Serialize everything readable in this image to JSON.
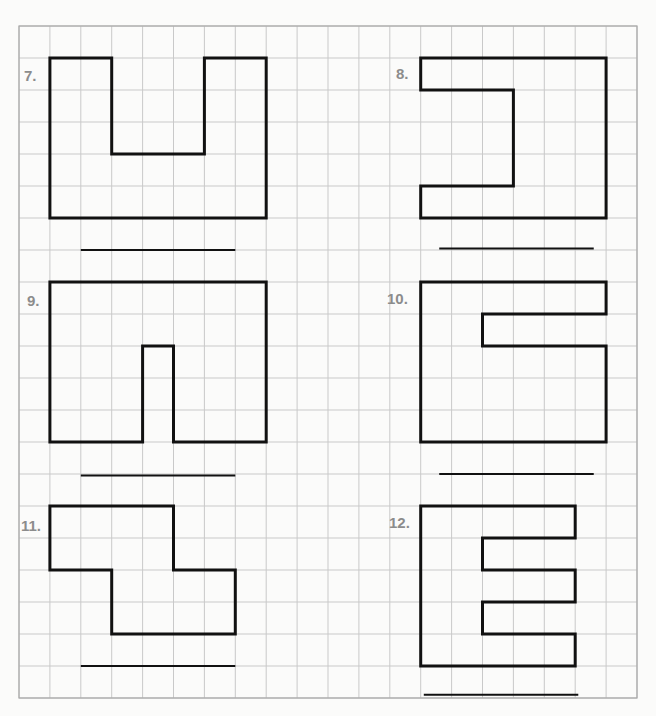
{
  "page": {
    "type": "worksheet",
    "background": "#fbfbfa"
  },
  "grid": {
    "origin_x": 19,
    "origin_y": 26,
    "cell_w": 30.9,
    "cell_h": 32,
    "cols": 20,
    "rows": 21,
    "line_color": "#c9c9c9"
  },
  "problems": [
    {
      "number": "7.",
      "label_pos": [
        24,
        81
      ],
      "outline": [
        [
          1,
          1
        ],
        [
          3,
          1
        ],
        [
          3,
          4
        ],
        [
          6,
          4
        ],
        [
          6,
          1
        ],
        [
          8,
          1
        ],
        [
          8,
          6
        ],
        [
          1,
          6
        ]
      ],
      "answer_line": {
        "from": [
          2,
          7
        ],
        "to": [
          7,
          7
        ],
        "value": ""
      }
    },
    {
      "number": "8.",
      "label_pos": [
        396,
        79
      ],
      "outline": [
        [
          13,
          1
        ],
        [
          19,
          1
        ],
        [
          19,
          6
        ],
        [
          13,
          6
        ],
        [
          13,
          5
        ],
        [
          16,
          5
        ],
        [
          16,
          2
        ],
        [
          13,
          2
        ]
      ],
      "answer_line": {
        "from": [
          13.6,
          6.95
        ],
        "to": [
          18.6,
          6.95
        ],
        "value": ""
      }
    },
    {
      "number": "9.",
      "label_pos": [
        27,
        306
      ],
      "outline": [
        [
          1,
          8
        ],
        [
          8,
          8
        ],
        [
          8,
          13
        ],
        [
          5,
          13
        ],
        [
          5,
          10
        ],
        [
          4,
          10
        ],
        [
          4,
          13
        ],
        [
          1,
          13
        ]
      ],
      "answer_line": {
        "from": [
          2,
          14.05
        ],
        "to": [
          7,
          14.05
        ],
        "value": ""
      }
    },
    {
      "number": "10.",
      "label_pos": [
        387,
        304
      ],
      "outline": [
        [
          13,
          8
        ],
        [
          19,
          8
        ],
        [
          19,
          9
        ],
        [
          15,
          9
        ],
        [
          15,
          10
        ],
        [
          19,
          10
        ],
        [
          19,
          13
        ],
        [
          13,
          13
        ]
      ],
      "answer_line": {
        "from": [
          13.6,
          14
        ],
        "to": [
          18.6,
          14
        ],
        "value": ""
      }
    },
    {
      "number": "11.",
      "label_pos": [
        21,
        531
      ],
      "outline": [
        [
          1,
          15
        ],
        [
          5,
          15
        ],
        [
          5,
          17
        ],
        [
          7,
          17
        ],
        [
          7,
          19
        ],
        [
          3,
          19
        ],
        [
          3,
          17
        ],
        [
          1,
          17
        ]
      ],
      "answer_line": {
        "from": [
          2,
          20
        ],
        "to": [
          7,
          20
        ],
        "value": ""
      }
    },
    {
      "number": "12.",
      "label_pos": [
        389,
        528
      ],
      "outline": [
        [
          13,
          15
        ],
        [
          18,
          15
        ],
        [
          18,
          16
        ],
        [
          15,
          16
        ],
        [
          15,
          17
        ],
        [
          18,
          17
        ],
        [
          18,
          18
        ],
        [
          15,
          18
        ],
        [
          15,
          19
        ],
        [
          18,
          19
        ],
        [
          18,
          20
        ],
        [
          13,
          20
        ]
      ],
      "answer_line": {
        "from": [
          13.1,
          20.9
        ],
        "to": [
          18.1,
          20.9
        ],
        "value": ""
      }
    }
  ]
}
